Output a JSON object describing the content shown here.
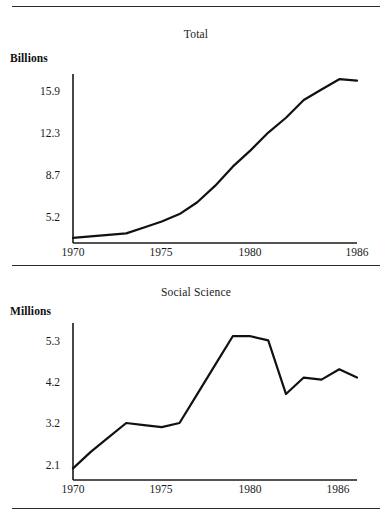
{
  "figure": {
    "rules": [
      "top-rule",
      "middle-rule",
      "bottom-rule"
    ],
    "ink_color": "#1a1a1a",
    "background": "#ffffff"
  },
  "chart_data": [
    {
      "type": "line",
      "title": "Total",
      "ylabel": "Billions",
      "xlabel": "",
      "unit": "Billions",
      "x": [
        1970,
        1971,
        1972,
        1973,
        1974,
        1975,
        1976,
        1977,
        1978,
        1979,
        1980,
        1981,
        1982,
        1983,
        1984,
        1985,
        1986
      ],
      "values": [
        5.2,
        5.3,
        5.4,
        5.5,
        5.9,
        6.3,
        6.8,
        7.6,
        8.7,
        10.0,
        11.1,
        12.3,
        13.3,
        14.5,
        15.2,
        15.9,
        15.8
      ],
      "xticks": [
        "1970",
        "1975",
        "1980",
        "1986"
      ],
      "xtick_values": [
        1970,
        1975,
        1980,
        1986
      ],
      "yticks": [
        "5.2",
        "8.7",
        "12.3",
        "15.9"
      ],
      "ytick_values": [
        5.2,
        8.7,
        12.3,
        15.9
      ],
      "xlim": [
        1970,
        1986
      ],
      "ylim": [
        4.85,
        16.25
      ],
      "grid": false,
      "legend": false,
      "line_color": "#111111",
      "line_width": 2.2
    },
    {
      "type": "line",
      "title": "Social Science",
      "ylabel": "Millions",
      "xlabel": "",
      "unit": "Millions",
      "x": [
        1970,
        1971,
        1972,
        1973,
        1974,
        1975,
        1976,
        1977,
        1978,
        1979,
        1980,
        1981,
        1982,
        1983,
        1984,
        1985,
        1986
      ],
      "values": [
        2.1,
        2.5,
        2.85,
        3.2,
        3.15,
        3.1,
        3.2,
        3.9,
        4.6,
        5.3,
        5.3,
        5.2,
        3.9,
        4.3,
        4.25,
        4.5,
        4.3
      ],
      "xticks": [
        "1970",
        "1975",
        "1980",
        "1986"
      ],
      "xtick_values": [
        1970,
        1975,
        1980,
        1986
      ],
      "yticks": [
        "2.1",
        "3.2",
        "4.2",
        "5.3"
      ],
      "ytick_values": [
        2.1,
        3.2,
        4.2,
        5.3
      ],
      "xlim": [
        1970,
        1986
      ],
      "ylim": [
        1.82,
        5.62
      ],
      "grid": false,
      "legend": false,
      "line_color": "#111111",
      "line_width": 2.2
    }
  ]
}
